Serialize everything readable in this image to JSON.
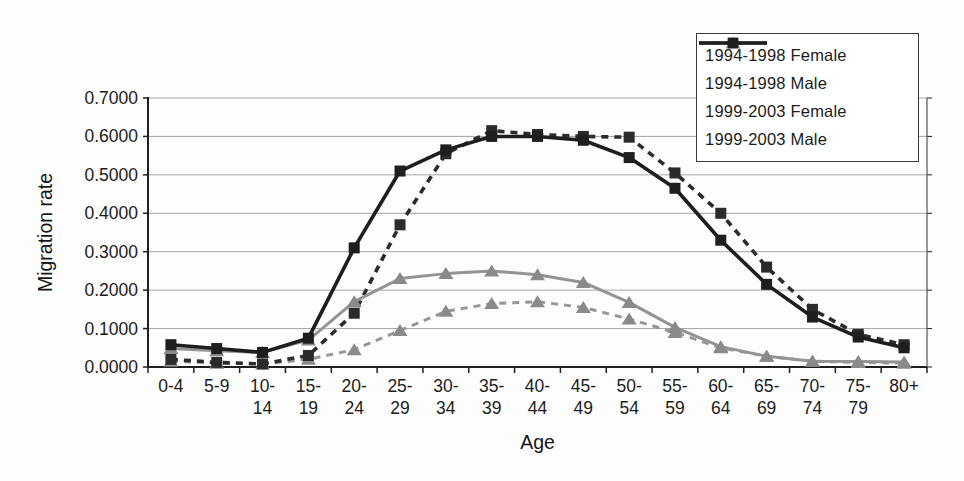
{
  "figure": {
    "background": "#fdfdfd",
    "axis_color": "#1f1f1f",
    "gridline_color": "#a6a6a6"
  },
  "chart_data": {
    "type": "line",
    "xlabel": "Age",
    "ylabel": "Migration rate",
    "ylim": [
      0,
      0.7
    ],
    "ytick_step": 0.1,
    "ytick_labels": [
      "0.0000",
      "0.1000",
      "0.2000",
      "0.3000",
      "0.4000",
      "0.5000",
      "0.6000",
      "0.7000"
    ],
    "grid": "horizontal",
    "legend_position": "top-right",
    "categories": [
      "0-4",
      "5-9",
      "10-14",
      "15-19",
      "20-24",
      "25-29",
      "30-34",
      "35-39",
      "40-44",
      "45-49",
      "50-54",
      "55-59",
      "60-64",
      "65-69",
      "70-74",
      "75-79",
      "80+"
    ],
    "categories_display": [
      [
        "0-4"
      ],
      [
        "5-9"
      ],
      [
        "10-",
        "14"
      ],
      [
        "15-",
        "19"
      ],
      [
        "20-",
        "24"
      ],
      [
        "25-",
        "29"
      ],
      [
        "30-",
        "34"
      ],
      [
        "35-",
        "39"
      ],
      [
        "40-",
        "44"
      ],
      [
        "45-",
        "49"
      ],
      [
        "50-",
        "54"
      ],
      [
        "55-",
        "59"
      ],
      [
        "60-",
        "64"
      ],
      [
        "65-",
        "69"
      ],
      [
        "70-",
        "74"
      ],
      [
        "75-",
        "79"
      ],
      [
        "80+"
      ]
    ],
    "series": [
      {
        "name": "1994-1998 Female",
        "color": "#979797",
        "line": "dashed",
        "marker": "triangle",
        "marker_color": "#8a8a8a",
        "values": [
          0.015,
          0.01,
          0.008,
          0.02,
          0.045,
          0.095,
          0.145,
          0.165,
          0.17,
          0.155,
          0.125,
          0.09,
          0.05,
          0.028,
          0.015,
          0.012,
          0.01
        ]
      },
      {
        "name": "1994-1998 Male",
        "color": "#2b2b2b",
        "line": "dashed",
        "marker": "square",
        "marker_color": "#2b2b2b",
        "values": [
          0.02,
          0.012,
          0.008,
          0.03,
          0.14,
          0.37,
          0.555,
          0.615,
          0.605,
          0.6,
          0.598,
          0.505,
          0.4,
          0.26,
          0.15,
          0.085,
          0.058
        ]
      },
      {
        "name": "1999-2003 Female",
        "color": "#949494",
        "line": "solid",
        "marker": "triangle",
        "marker_color": "#8a8a8a",
        "values": [
          0.048,
          0.042,
          0.038,
          0.07,
          0.17,
          0.23,
          0.243,
          0.25,
          0.24,
          0.22,
          0.168,
          0.103,
          0.053,
          0.028,
          0.015,
          0.014,
          0.013
        ]
      },
      {
        "name": "1999-2003 Male",
        "color": "#1e1e1e",
        "line": "solid",
        "marker": "square",
        "marker_color": "#1e1e1e",
        "values": [
          0.058,
          0.048,
          0.038,
          0.075,
          0.31,
          0.51,
          0.565,
          0.6,
          0.6,
          0.59,
          0.545,
          0.465,
          0.33,
          0.215,
          0.13,
          0.078,
          0.05
        ]
      }
    ]
  }
}
